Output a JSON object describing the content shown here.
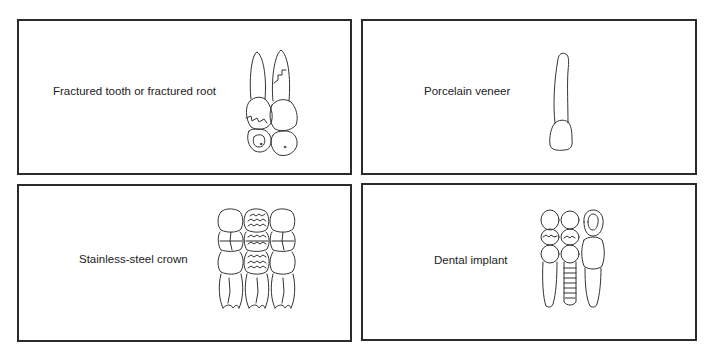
{
  "panels": [
    {
      "id": "fractured",
      "label": "Fractured tooth or fractured root",
      "icon": "fractured-teeth-illustration"
    },
    {
      "id": "veneer",
      "label": "Porcelain veneer",
      "icon": "single-incisor-illustration"
    },
    {
      "id": "crown",
      "label": "Stainless-steel crown",
      "icon": "crowned-molars-illustration"
    },
    {
      "id": "implant",
      "label": "Dental implant",
      "icon": "implant-teeth-illustration"
    }
  ],
  "colors": {
    "border": "#2b2b2b",
    "line": "#333333",
    "background": "#ffffff"
  }
}
